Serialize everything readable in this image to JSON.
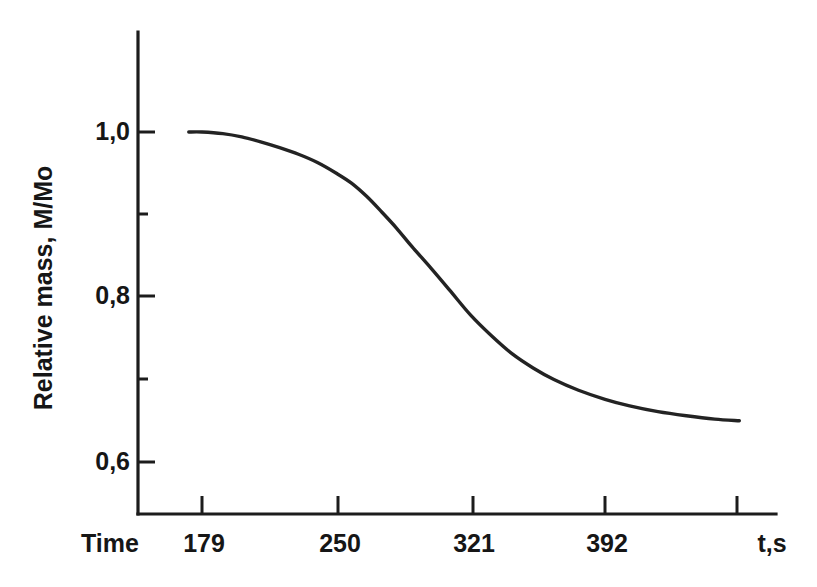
{
  "chart_data": {
    "type": "line",
    "title": "",
    "subtitle": "",
    "xlabel": "Time",
    "xunit": "t,s",
    "ylabel": "Relative mass, M/Mo",
    "x": [
      172,
      179,
      190,
      200,
      210,
      220,
      230,
      240,
      250,
      258,
      266,
      274,
      282,
      290,
      300,
      310,
      321,
      332,
      343,
      354,
      365,
      378,
      392,
      405,
      420,
      435,
      450,
      463
    ],
    "values": [
      1.0,
      1.0,
      0.998,
      0.994,
      0.988,
      0.981,
      0.973,
      0.963,
      0.95,
      0.938,
      0.922,
      0.903,
      0.883,
      0.861,
      0.835,
      0.808,
      0.778,
      0.753,
      0.731,
      0.714,
      0.7,
      0.687,
      0.676,
      0.668,
      0.661,
      0.656,
      0.652,
      0.65
    ],
    "series": [
      {
        "name": "Relative mass",
        "values": [
          1.0,
          1.0,
          0.998,
          0.994,
          0.988,
          0.981,
          0.973,
          0.963,
          0.95,
          0.938,
          0.922,
          0.903,
          0.883,
          0.861,
          0.835,
          0.808,
          0.778,
          0.753,
          0.731,
          0.714,
          0.7,
          0.687,
          0.676,
          0.668,
          0.661,
          0.656,
          0.652,
          0.65
        ]
      }
    ],
    "xticks": [
      179,
      250,
      321,
      392
    ],
    "xtick_labels": [
      "179",
      "250",
      "321",
      "392"
    ],
    "yticks": [
      0.6,
      0.7,
      0.8,
      0.9,
      1.0
    ],
    "ytick_labels": [
      "0,6",
      "",
      "0,8",
      "",
      "1,0"
    ],
    "ymajor_labels": [
      "1,0",
      "0,8",
      "0,6"
    ],
    "xlim": [
      168,
      471
    ],
    "ylim": [
      0.555,
      1.095
    ],
    "grid": false,
    "legend": null,
    "line_color": "#232323",
    "axis_color": "#1c1c1c",
    "background": "#ffffff",
    "decimal_separator": ","
  },
  "axes": {
    "x_axis_title": "Time",
    "x_axis_unit": "t,s",
    "y_axis_title": "Relative mass, M/Mo",
    "x_tick_labels": [
      "179",
      "250",
      "321",
      "392"
    ],
    "y_tick_labels": [
      "1,0",
      "0,8",
      "0,6"
    ]
  }
}
